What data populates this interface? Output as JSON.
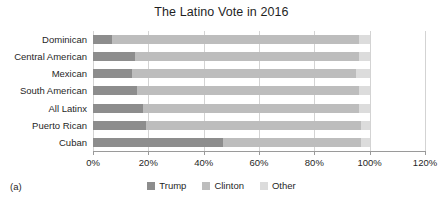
{
  "figure": {
    "caption_label": "(a)"
  },
  "chart_data": {
    "type": "bar",
    "orientation": "horizontal",
    "stacked": true,
    "title": "The Latino Vote in 2016",
    "xlabel": "",
    "ylabel": "",
    "xlim": [
      0,
      120
    ],
    "xtick_labels": [
      "0%",
      "20%",
      "40%",
      "60%",
      "80%",
      "100%",
      "120%"
    ],
    "xticks": [
      0,
      20,
      40,
      60,
      80,
      100,
      120
    ],
    "grid": true,
    "legend_position": "bottom",
    "categories": [
      "Dominican",
      "Central American",
      "Mexican",
      "South American",
      "All Latinx",
      "Puerto Rican",
      "Cuban"
    ],
    "series": [
      {
        "name": "Trump",
        "color": "#8d8d8d",
        "values": [
          7,
          15,
          14,
          16,
          18,
          19,
          47
        ]
      },
      {
        "name": "Clinton",
        "color": "#bdbdbd",
        "values": [
          89,
          81,
          81,
          80,
          78,
          78,
          50
        ]
      },
      {
        "name": "Other",
        "color": "#dcdcdc",
        "values": [
          4,
          4,
          5,
          4,
          4,
          3,
          3
        ]
      }
    ]
  },
  "legend": {
    "items": [
      {
        "label": "Trump",
        "color": "#8d8d8d"
      },
      {
        "label": "Clinton",
        "color": "#bdbdbd"
      },
      {
        "label": "Other",
        "color": "#dcdcdc"
      }
    ]
  }
}
